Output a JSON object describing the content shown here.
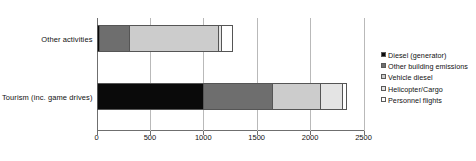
{
  "chart_data": {
    "type": "bar",
    "orientation": "horizontal",
    "stacked": true,
    "title": "",
    "xlabel": "",
    "ylabel": "",
    "categories": [
      "Other activities",
      "Tourism (inc. game drives)"
    ],
    "xlim": [
      0,
      2500
    ],
    "xticks": [
      0,
      500,
      1000,
      1500,
      2000,
      2500
    ],
    "xtick_labels": [
      "0",
      "500",
      "1000",
      "1500",
      "2000",
      "2500"
    ],
    "grid": true,
    "legend_position": "right",
    "series": [
      {
        "name": "Diesel (generator)",
        "color": "#0a0a0a",
        "values": [
          37,
          1006
        ]
      },
      {
        "name": "Other building emissions",
        "color": "#6e6e6e",
        "values": [
          290,
          659
        ]
      },
      {
        "name": "Vehicle diesel",
        "color": "#cccccc",
        "values": [
          835,
          460
        ]
      },
      {
        "name": "Helicopter/Cargo",
        "color": "#e4e4e4",
        "values": [
          37,
          215
        ]
      },
      {
        "name": "Personnel flights",
        "color": "#ffffff",
        "values": [
          113,
          45
        ]
      }
    ],
    "totals": [
      1313,
      2384
    ]
  },
  "legend": {
    "items": [
      {
        "label": "Diesel (generator)",
        "color": "#0a0a0a"
      },
      {
        "label": "Other building emissions",
        "color": "#6e6e6e"
      },
      {
        "label": "Vehicle diesel",
        "color": "#cccccc"
      },
      {
        "label": "Helicopter/Cargo",
        "color": "#e4e4e4"
      },
      {
        "label": "Personnel flights",
        "color": "#ffffff"
      }
    ]
  }
}
